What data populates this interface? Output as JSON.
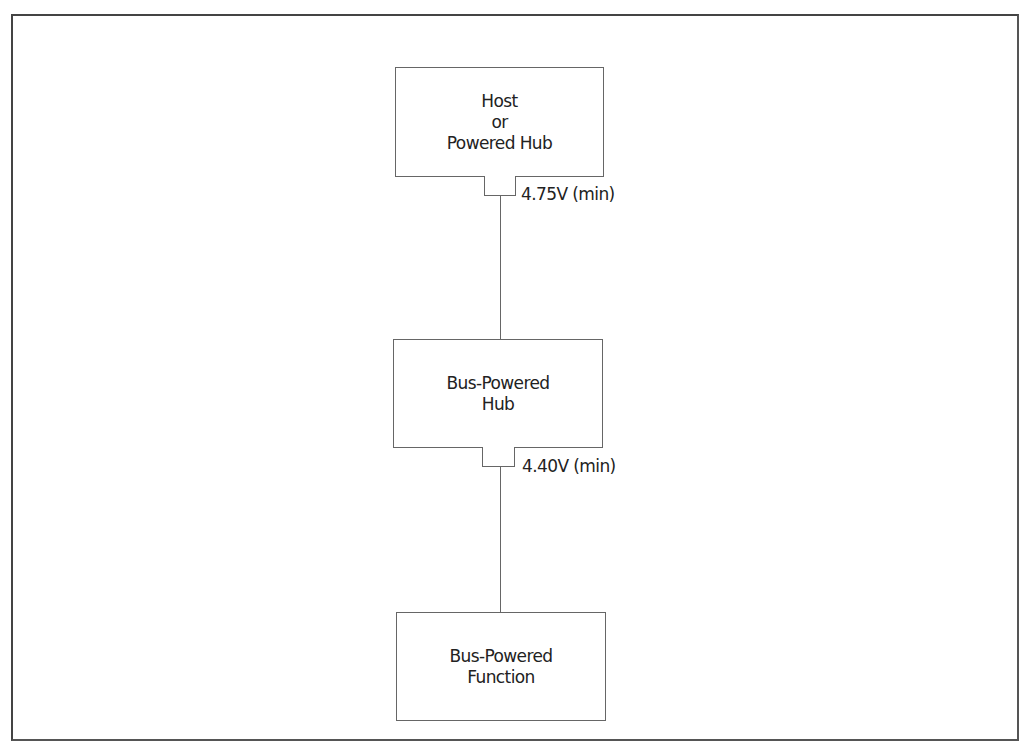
{
  "diagram": {
    "type": "power-topology",
    "nodes": [
      {
        "id": "host",
        "lines": [
          "Host",
          "or",
          "Powered Hub"
        ]
      },
      {
        "id": "bus_hub",
        "lines": [
          "Bus-Powered",
          "Hub"
        ]
      },
      {
        "id": "bus_function",
        "lines": [
          "Bus-Powered",
          "Function"
        ]
      }
    ],
    "edges": [
      {
        "from": "host",
        "to": "bus_hub",
        "label": "4.75V (min)"
      },
      {
        "from": "bus_hub",
        "to": "bus_function",
        "label": "4.40V (min)"
      }
    ],
    "colors": {
      "line": "#666666",
      "frame": "#444444",
      "background": "#ffffff"
    }
  }
}
